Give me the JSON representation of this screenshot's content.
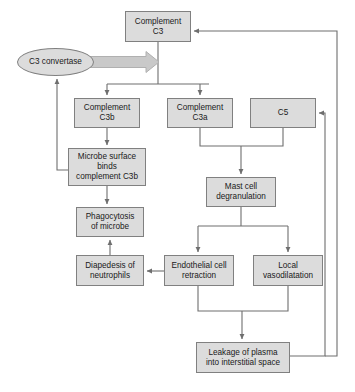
{
  "diagram": {
    "type": "flowchart",
    "canvas": {
      "width": 355,
      "height": 392
    },
    "style": {
      "node_fill": "#dcdcdc",
      "node_border": "#808080",
      "edge_color": "#6e6e6e",
      "block_arrow_fill": "#c9c9c9",
      "block_arrow_border": "#a8a8a8",
      "background": "#ffffff",
      "text_color": "#1a1a1a"
    },
    "nodes": [
      {
        "id": "c3",
        "label": "Complement\nC3",
        "shape": "rect",
        "x": 125,
        "y": 11,
        "w": 66,
        "h": 31
      },
      {
        "id": "c3convertase",
        "label": "C3 convertase",
        "shape": "ellipse",
        "x": 17,
        "y": 48,
        "w": 77,
        "h": 28
      },
      {
        "id": "c3b",
        "label": "Complement\nC3b",
        "shape": "rect",
        "x": 74,
        "y": 98,
        "w": 66,
        "h": 30
      },
      {
        "id": "c3a",
        "label": "Complement\nC3a",
        "shape": "rect",
        "x": 167,
        "y": 98,
        "w": 66,
        "h": 30
      },
      {
        "id": "c5",
        "label": "C5",
        "shape": "rect",
        "x": 250,
        "y": 98,
        "w": 66,
        "h": 30
      },
      {
        "id": "microbe",
        "label": "Microbe surface\nbinds\ncomplement C3b",
        "shape": "rect",
        "x": 68,
        "y": 148,
        "w": 78,
        "h": 38
      },
      {
        "id": "mastcell",
        "label": "Mast cell\ndegranulation",
        "shape": "rect",
        "x": 206,
        "y": 177,
        "w": 70,
        "h": 30
      },
      {
        "id": "phagocytosis",
        "label": "Phagocytosis\nof microbe",
        "shape": "rect",
        "x": 76,
        "y": 207,
        "w": 68,
        "h": 30
      },
      {
        "id": "diapedesis",
        "label": "Diapedesis of\nneutrophils",
        "shape": "rect",
        "x": 76,
        "y": 255,
        "w": 68,
        "h": 31
      },
      {
        "id": "endothelial",
        "label": "Endothelial cell\nretraction",
        "shape": "rect",
        "x": 164,
        "y": 255,
        "w": 70,
        "h": 31
      },
      {
        "id": "vasodilatation",
        "label": "Local\nvasodilatation",
        "shape": "rect",
        "x": 253,
        "y": 255,
        "w": 70,
        "h": 31
      },
      {
        "id": "leakage",
        "label": "Leakage of plasma\ninto interstitial space",
        "shape": "rect",
        "x": 196,
        "y": 342,
        "w": 94,
        "h": 31
      }
    ],
    "edges": [
      {
        "from": "c3",
        "to": "c3b",
        "style": "block-arrow-split"
      },
      {
        "from": "c3",
        "to": "c3a",
        "style": "line-arrow"
      },
      {
        "from": "c3convertase",
        "to": "c3",
        "style": "thick-block-arrow"
      },
      {
        "from": "c3b",
        "to": "microbe",
        "style": "line-arrow"
      },
      {
        "from": "microbe",
        "to": "c3convertase",
        "style": "feedback-left-arrow"
      },
      {
        "from": "microbe",
        "to": "phagocytosis",
        "style": "line-arrow"
      },
      {
        "from": "c3a",
        "to": "mastcell",
        "style": "merge-line-arrow"
      },
      {
        "from": "c5",
        "to": "mastcell",
        "style": "merge-line-arrow"
      },
      {
        "from": "mastcell",
        "to": "endothelial",
        "style": "split-line-arrow"
      },
      {
        "from": "mastcell",
        "to": "vasodilatation",
        "style": "split-line-arrow"
      },
      {
        "from": "endothelial",
        "to": "diapedesis",
        "style": "line-arrow-left"
      },
      {
        "from": "diapedesis",
        "to": "phagocytosis",
        "style": "line-arrow-up"
      },
      {
        "from": "endothelial",
        "to": "leakage",
        "style": "merge-line-arrow"
      },
      {
        "from": "vasodilatation",
        "to": "leakage",
        "style": "merge-line-arrow"
      },
      {
        "from": "leakage",
        "to": "c5",
        "style": "feedback-right-arrow"
      },
      {
        "from": "leakage",
        "to": "c3",
        "style": "feedback-right-outer-arrow"
      }
    ]
  }
}
